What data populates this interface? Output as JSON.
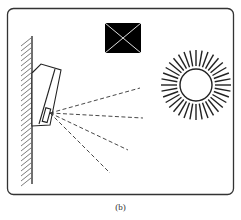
{
  "figure": {
    "caption": "(b)",
    "elements": {
      "frame": "rounded-rectangle-border",
      "wall": "hatched-wall",
      "sensor": "wall-mounted-device",
      "obstacle": "black-square-with-cross",
      "light_source": "sun"
    },
    "sun": {
      "cx": 196,
      "cy": 85,
      "inner_radius": 16,
      "outer_radius": 35,
      "ray_count": 36
    },
    "beams": [
      {
        "x2": 140,
        "y2": 88
      },
      {
        "x2": 143,
        "y2": 118
      },
      {
        "x2": 128,
        "y2": 150
      },
      {
        "x2": 110,
        "y2": 173
      }
    ],
    "colors": {
      "stroke": "#222222",
      "fill": "#000000",
      "background": "#ffffff"
    }
  }
}
